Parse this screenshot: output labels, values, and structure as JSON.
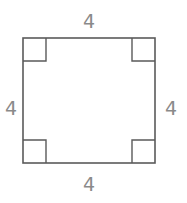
{
  "figure": {
    "name": "square-with-right-angle-marks",
    "shape": "square",
    "background_color": "#ffffff",
    "stroke_color": "#5a5a5a",
    "stroke_width": 1.6,
    "label_color": "#8a8a8a",
    "geometry": {
      "left": 23,
      "top": 38,
      "right": 155,
      "bottom": 163,
      "width": 132,
      "height": 125,
      "corner_mark_size": 23
    },
    "labels": {
      "top": "4",
      "right": "4",
      "bottom": "4",
      "left": "4"
    },
    "label_positions": {
      "top": {
        "x": 89,
        "y": 28
      },
      "right": {
        "x": 171,
        "y": 108
      },
      "bottom": {
        "x": 89,
        "y": 190
      },
      "left": {
        "x": 11,
        "y": 108
      }
    },
    "corner_marks": [
      {
        "name": "top-left",
        "x": 23,
        "y": 38
      },
      {
        "name": "top-right",
        "x": 155,
        "y": 38
      },
      {
        "name": "bottom-left",
        "x": 23,
        "y": 163
      },
      {
        "name": "bottom-right",
        "x": 155,
        "y": 163
      }
    ]
  }
}
